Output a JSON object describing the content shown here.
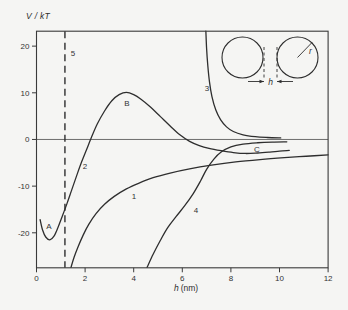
{
  "figure": {
    "bg": "#f5f5f3",
    "ink": "#2e2e2e",
    "axis_color": "#3a3a3a",
    "zero_line_color": "#4a4a4a"
  },
  "chart_data": {
    "type": "line",
    "title": "",
    "ylabel": "V / kT",
    "xlabel": "h (nm)",
    "xlabel_var": "h",
    "xlabel_unit": "(nm)",
    "xlim": [
      0,
      12
    ],
    "ylim": [
      -27.5,
      23.2
    ],
    "x_ticks": [
      0,
      2,
      4,
      6,
      8,
      10,
      12
    ],
    "y_ticks": [
      20,
      10,
      0,
      -10,
      -20
    ],
    "grid": false,
    "zero_line": true,
    "legend": "none",
    "series": [
      {
        "name": "curve-1",
        "label": "1",
        "points": [
          [
            1.42,
            -27.4
          ],
          [
            1.55,
            -25.2
          ],
          [
            1.72,
            -22.9
          ],
          [
            1.92,
            -20.5
          ],
          [
            2.15,
            -18.2
          ],
          [
            2.45,
            -15.9
          ],
          [
            2.8,
            -13.9
          ],
          [
            3.2,
            -12.2
          ],
          [
            3.7,
            -10.6
          ],
          [
            4.2,
            -9.4
          ],
          [
            4.8,
            -8.2
          ],
          [
            5.5,
            -7.2
          ],
          [
            6.3,
            -6.3
          ],
          [
            7.2,
            -5.5
          ],
          [
            8.2,
            -4.8
          ],
          [
            9.2,
            -4.3
          ],
          [
            10.2,
            -3.9
          ],
          [
            11.1,
            -3.6
          ],
          [
            12.0,
            -3.3
          ]
        ]
      },
      {
        "name": "curve-2",
        "label": "2",
        "points": [
          [
            0.15,
            -17.2
          ],
          [
            0.25,
            -19.4
          ],
          [
            0.38,
            -20.9
          ],
          [
            0.55,
            -21.5
          ],
          [
            0.72,
            -20.7
          ],
          [
            0.88,
            -18.9
          ],
          [
            1.05,
            -16.6
          ],
          [
            1.25,
            -13.8
          ],
          [
            1.45,
            -10.8
          ],
          [
            1.65,
            -7.8
          ],
          [
            1.85,
            -4.9
          ],
          [
            2.05,
            -2.3
          ],
          [
            2.25,
            0.3
          ],
          [
            2.5,
            3.3
          ],
          [
            2.8,
            6.1
          ],
          [
            3.1,
            8.3
          ],
          [
            3.4,
            9.6
          ],
          [
            3.7,
            10.1
          ],
          [
            4.0,
            9.6
          ],
          [
            4.3,
            8.6
          ],
          [
            4.7,
            6.9
          ],
          [
            5.1,
            4.9
          ],
          [
            5.5,
            2.9
          ],
          [
            5.9,
            1.0
          ],
          [
            6.3,
            -0.4
          ],
          [
            6.7,
            -1.3
          ],
          [
            7.1,
            -1.9
          ],
          [
            7.6,
            -2.4
          ],
          [
            8.1,
            -2.8
          ],
          [
            8.6,
            -3.0
          ],
          [
            9.1,
            -2.9
          ],
          [
            9.6,
            -2.7
          ],
          [
            10.0,
            -2.5
          ],
          [
            10.4,
            -2.35
          ]
        ]
      },
      {
        "name": "curve-3",
        "label": "3",
        "points": [
          [
            6.97,
            23.2
          ],
          [
            7.0,
            19.5
          ],
          [
            7.05,
            15.8
          ],
          [
            7.12,
            12.3
          ],
          [
            7.22,
            9.2
          ],
          [
            7.38,
            6.3
          ],
          [
            7.58,
            4.2
          ],
          [
            7.82,
            2.7
          ],
          [
            8.1,
            1.7
          ],
          [
            8.5,
            1.0
          ],
          [
            9.0,
            0.6
          ],
          [
            9.5,
            0.42
          ],
          [
            10.05,
            0.32
          ]
        ]
      },
      {
        "name": "curve-4",
        "label": "4",
        "points": [
          [
            4.55,
            -27.4
          ],
          [
            4.8,
            -24.6
          ],
          [
            5.1,
            -21.6
          ],
          [
            5.4,
            -18.9
          ],
          [
            5.75,
            -16.5
          ],
          [
            6.1,
            -14.2
          ],
          [
            6.45,
            -11.6
          ],
          [
            6.75,
            -8.9
          ],
          [
            7.0,
            -6.4
          ],
          [
            7.3,
            -4.2
          ],
          [
            7.6,
            -2.7
          ],
          [
            8.0,
            -1.6
          ],
          [
            8.5,
            -1.0
          ],
          [
            9.1,
            -0.7
          ],
          [
            9.7,
            -0.55
          ],
          [
            10.3,
            -0.5
          ]
        ]
      }
    ],
    "vline": {
      "label": "5",
      "x": 1.17,
      "style": "dashed"
    },
    "annotations": [
      {
        "text": "5",
        "h": 1.5,
        "v": 18.5
      },
      {
        "text": "3",
        "h": 7.02,
        "v": 11.0
      },
      {
        "text": "B",
        "h": 3.72,
        "v": 7.8
      },
      {
        "text": "2",
        "h": 2.0,
        "v": -5.7
      },
      {
        "text": "1",
        "h": 4.01,
        "v": -12.1
      },
      {
        "text": "4",
        "h": 6.56,
        "v": -15.1
      },
      {
        "text": "A",
        "h": 0.51,
        "v": -18.5
      },
      {
        "text": "C",
        "h": 9.07,
        "v": -2.0
      }
    ],
    "inset": {
      "circles": [
        {
          "cx": 242.5,
          "cy": 57.5,
          "r": 20.5
        },
        {
          "cx": 297.5,
          "cy": 57.5,
          "r": 20.5
        }
      ],
      "gap_dashes": [
        {
          "x": 264,
          "y1": 47,
          "y2": 80
        },
        {
          "x": 277,
          "y1": 47,
          "y2": 80
        }
      ],
      "dim_y": 81.5,
      "dim_arrows": [
        {
          "x1": 248,
          "x2": 264
        },
        {
          "x1": 293,
          "x2": 277
        }
      ],
      "gap_label": {
        "text": "h",
        "x": 270.5,
        "y": 84.5
      },
      "radius_line": {
        "x1": 297.5,
        "y1": 57.5,
        "x2": 312,
        "y2": 42.5
      },
      "radius_label": {
        "text": "r",
        "x": 310.5,
        "y": 54
      }
    }
  }
}
